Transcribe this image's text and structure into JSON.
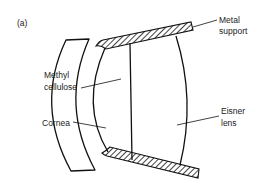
{
  "figure": {
    "panel_label": "(a)",
    "labels": {
      "metal_support_line1": "Metal",
      "metal_support_line2": "support",
      "methyl_line1": "Methyl",
      "methyl_line2": "cellulose",
      "cornea": "Cornea",
      "eisner_line1": "Eisner",
      "eisner_line2": "lens"
    },
    "colors": {
      "stroke": "#111111",
      "background": "#ffffff"
    }
  }
}
